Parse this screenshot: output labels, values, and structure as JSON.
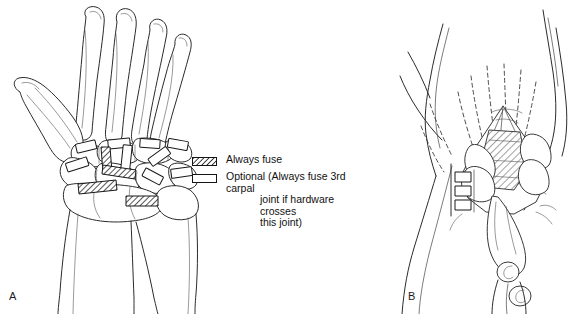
{
  "figure": {
    "kind": "medical-line-illustration",
    "caption_panels": [
      {
        "id": "A",
        "label": "A",
        "description": "Dorsal view of hand and wrist skeleton showing metacarpals, carpal bones, radius and ulna with fusion plates marked"
      },
      {
        "id": "B",
        "label": "B",
        "description": "Surgical dorsal exposure of the wrist showing retracted extensor tendons, exposed carpus and hardware"
      }
    ],
    "background_color": "#ffffff",
    "line_color": "#2b2b2b"
  },
  "legend": {
    "items": [
      {
        "swatch": "hatched",
        "swatch_name": "hatched-swatch",
        "label": "Always fuse",
        "continuation": []
      },
      {
        "swatch": "outline",
        "swatch_name": "outline-swatch",
        "label": "Optional (Always fuse 3rd carpal",
        "continuation": [
          "joint if hardware crosses",
          "this joint)"
        ]
      }
    ]
  },
  "panel_a": {
    "label": "A",
    "structures": [
      "thumb metacarpal",
      "index metacarpal",
      "middle metacarpal",
      "ring metacarpal",
      "little metacarpal",
      "trapezium",
      "trapezoid",
      "capitate",
      "hamate",
      "scaphoid",
      "lunate",
      "triquetrum",
      "radius",
      "ulna"
    ],
    "hardware": {
      "always_fuse_zones": 3,
      "optional_zones": 7
    }
  },
  "panel_b": {
    "label": "B",
    "structures": [
      "extensor tendons (retracted, dashed)",
      "dorsal capsule flap",
      "exposed carpus (hatched)",
      "forearm",
      "hardware screws"
    ]
  }
}
